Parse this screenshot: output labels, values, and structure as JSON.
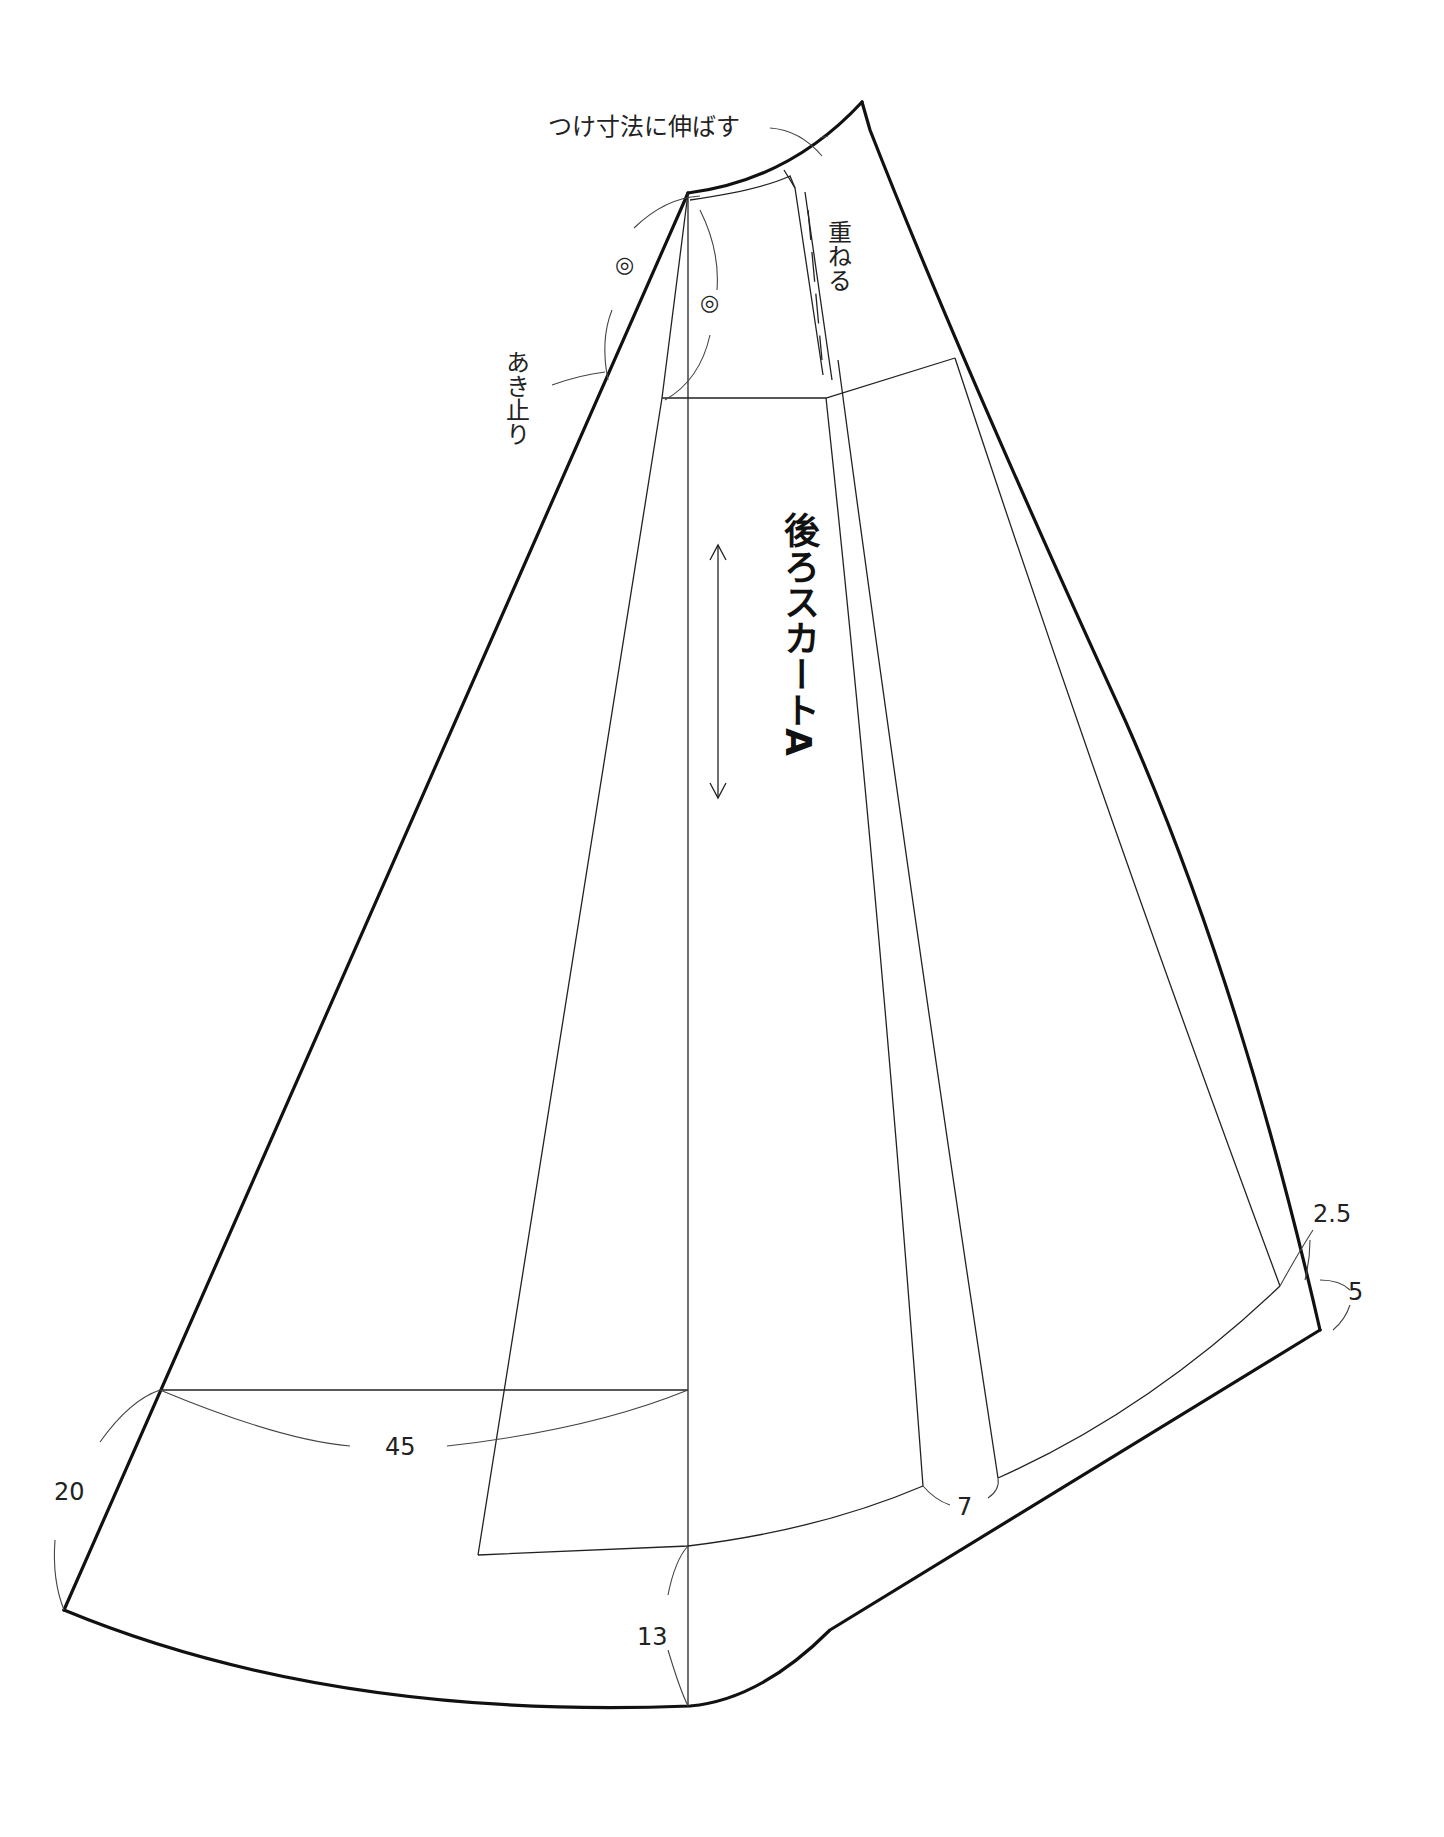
{
  "title_cut": "",
  "pattern": {
    "piece_name": "後ろスカートA",
    "labels": {
      "stretch_note": "つけ寸法に伸ばす",
      "overlap_note": "重ねる",
      "opening_end": "あき止り",
      "mark_1": "◎",
      "mark_2": "◎"
    },
    "dimensions": {
      "d_2_5": "2.5",
      "d_5": "5",
      "d_20": "20",
      "d_45": "45",
      "d_7": "7",
      "d_13": "13"
    },
    "grain_arrow": "grainline-arrow"
  }
}
